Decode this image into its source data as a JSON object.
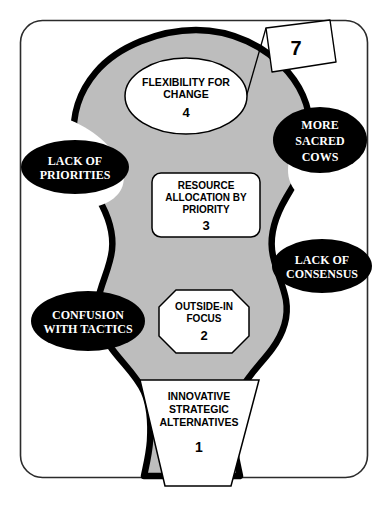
{
  "diagram": {
    "colors": {
      "background": "#ffffff",
      "blob_fill": "#bdbdbd",
      "blob_outline": "#000000",
      "obstacle_fill": "#000000",
      "obstacle_text": "#ffffff",
      "shape_fill": "#ffffff",
      "shape_outline": "#000000",
      "frame_outline": "#2b2b2b"
    },
    "frame": {
      "name": "outer-border"
    },
    "flag": {
      "label": "7",
      "name": "flag-marker"
    },
    "stages": [
      {
        "id": "stage-4",
        "shape": "ellipse",
        "lines": [
          "FLEXIBILITY FOR",
          "CHANGE"
        ],
        "number": "4"
      },
      {
        "id": "stage-3",
        "shape": "rounded-rect",
        "lines": [
          "RESOURCE",
          "ALLOCATION BY",
          "PRIORITY"
        ],
        "number": "3"
      },
      {
        "id": "stage-2",
        "shape": "octagon",
        "lines": [
          "OUTSIDE-IN",
          "FOCUS"
        ],
        "number": "2"
      },
      {
        "id": "stage-1",
        "shape": "trapezoid",
        "lines": [
          "INNOVATIVE",
          "STRATEGIC",
          "ALTERNATIVES"
        ],
        "number": "1"
      }
    ],
    "obstacles": [
      {
        "id": "obstacle-lack-of-priorities",
        "side": "left",
        "lines": [
          "LACK OF",
          "PRIORITIES"
        ]
      },
      {
        "id": "obstacle-more-sacred-cows",
        "side": "right",
        "lines": [
          "MORE",
          "SACRED",
          "COWS"
        ]
      },
      {
        "id": "obstacle-lack-of-consensus",
        "side": "right",
        "lines": [
          "LACK OF",
          "CONSENSUS"
        ]
      },
      {
        "id": "obstacle-confusion-with-tactics",
        "side": "left",
        "lines": [
          "CONFUSION",
          "WITH TACTICS"
        ]
      }
    ]
  }
}
